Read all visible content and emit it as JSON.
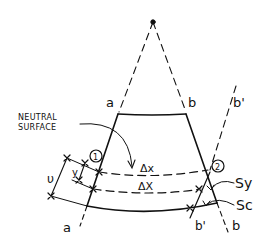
{
  "diagram": {
    "type": "beam-bending-strain-element",
    "labels": {
      "a_top": "a",
      "b_top": "b",
      "b_prime_top": "b'",
      "a_bottom": "a",
      "b_bottom": "b",
      "b_prime_bottom": "b'",
      "neutral_surface_line1": "NEUTRAL",
      "neutral_surface_line2": "SURFACE",
      "point_1": "1",
      "point_2": "2",
      "delta_x_upper": "Δx",
      "delta_x_lower": "ΔX",
      "y": "y",
      "v": "υ",
      "delta_s_y": "Sy",
      "delta_s_c": "Sc"
    },
    "colors": {
      "ink": "#111111",
      "background": "#ffffff"
    }
  }
}
